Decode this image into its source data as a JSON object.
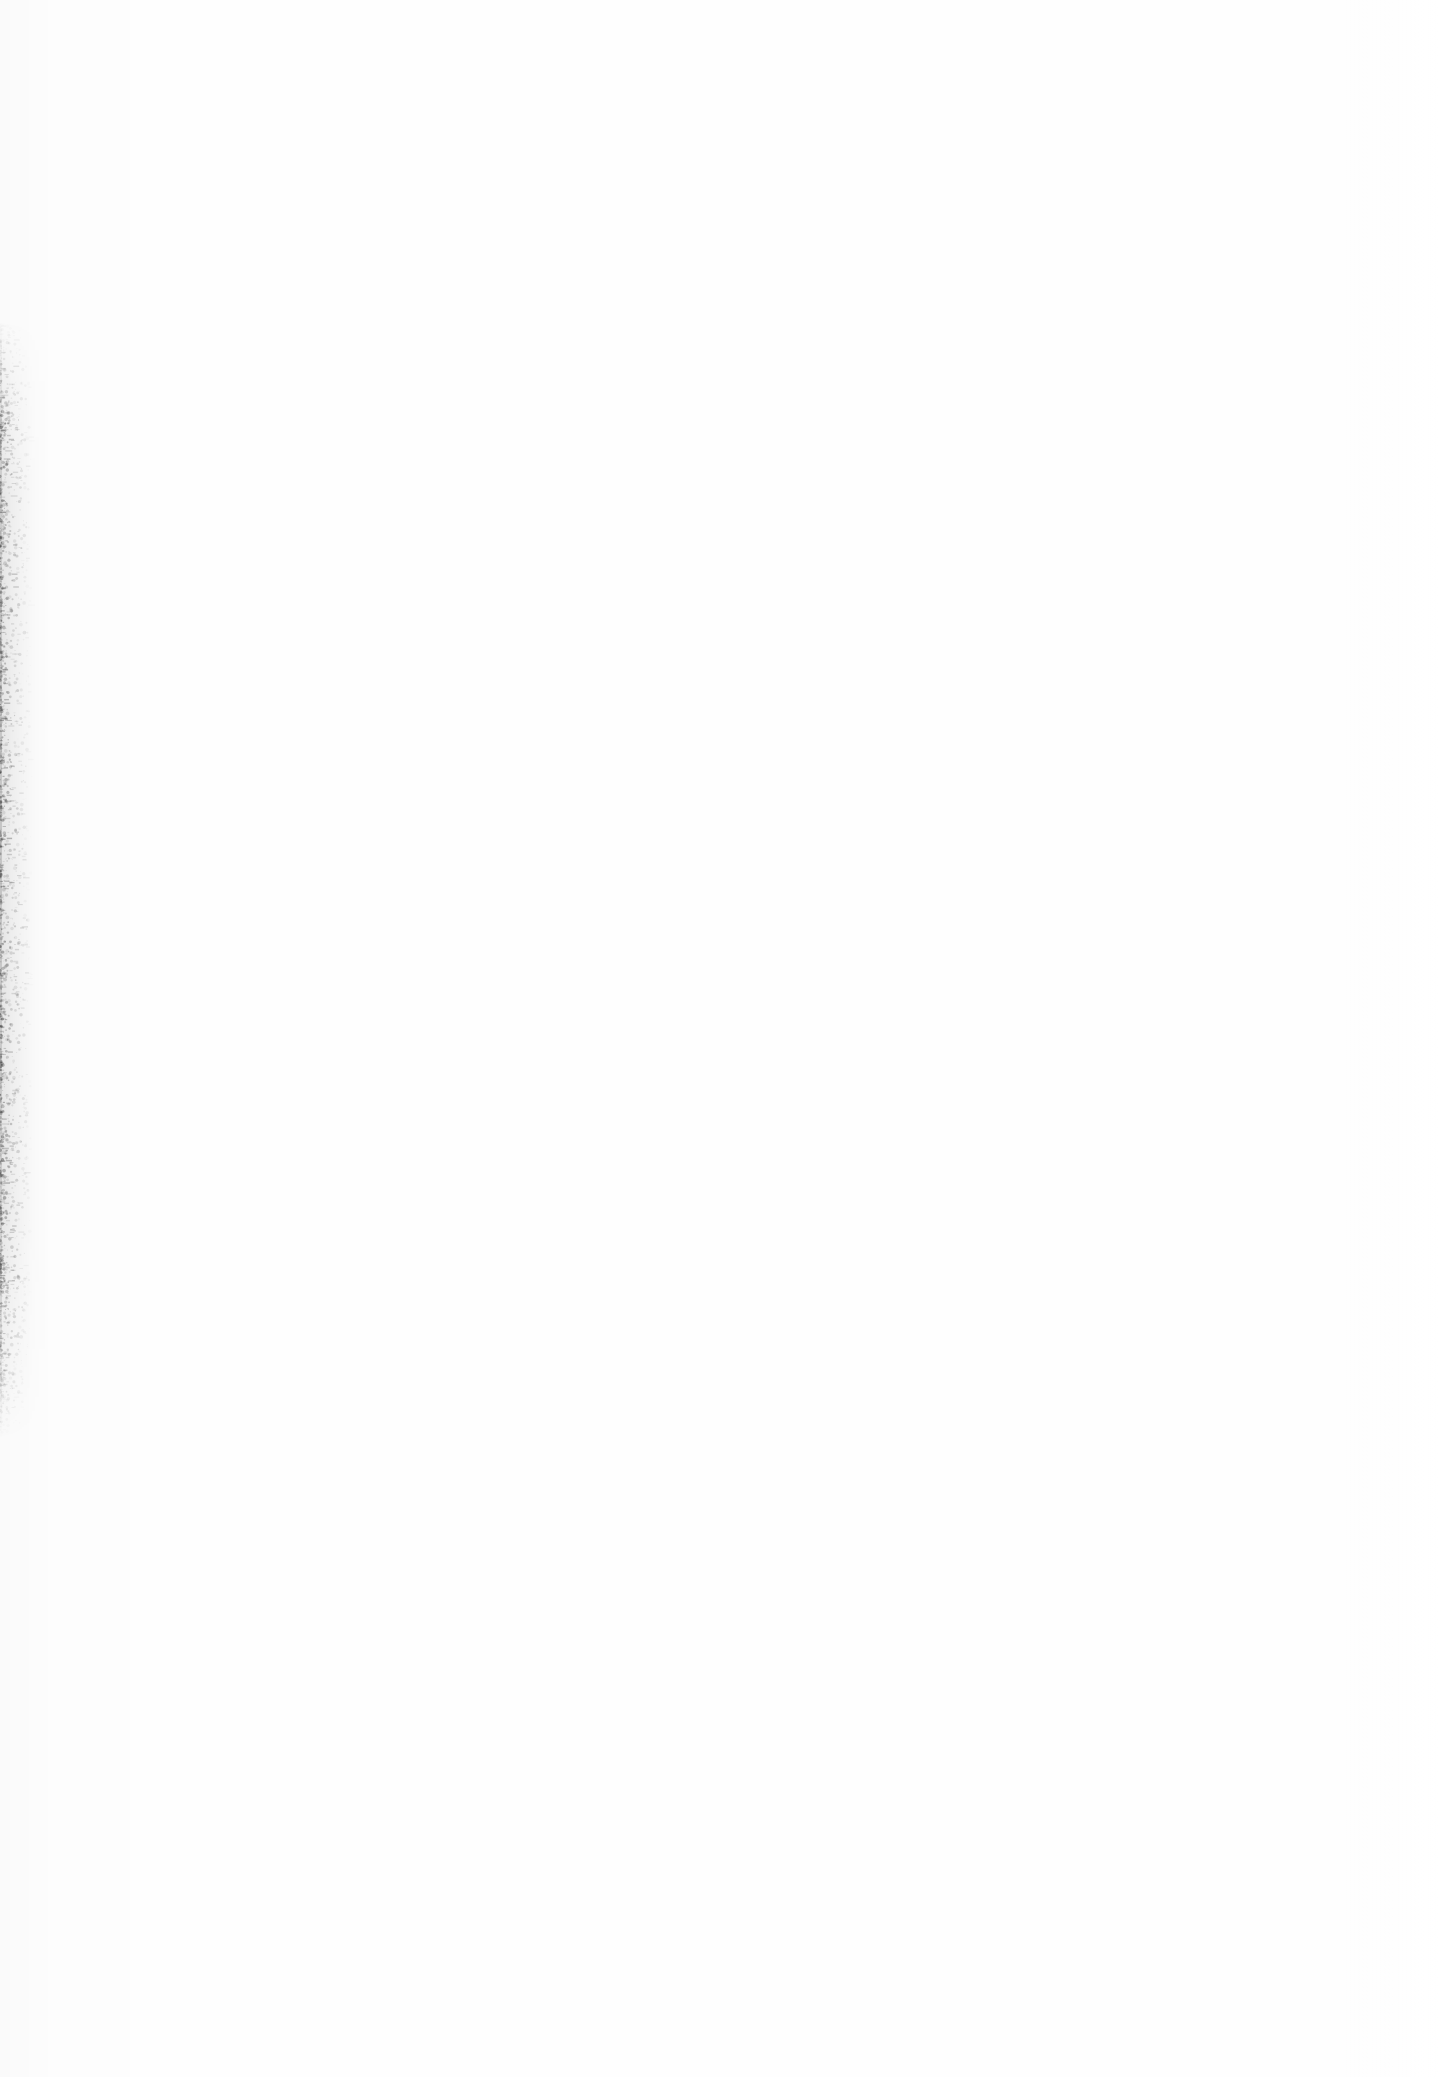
{
  "page": {
    "kind": "scanned-document-page",
    "state": "blank",
    "width": 1439,
    "height": 2077,
    "paper_color": "#fefefe",
    "ink_color": "#000000",
    "header_text": "",
    "footer_text": "",
    "page_number": "",
    "body_text": "",
    "accessible_description": "Blank scanned page with no printed text or figures"
  },
  "artifacts": {
    "gutter_band": {
      "label": "left-edge scan speckle",
      "x": 0,
      "y": 320,
      "width": 48,
      "height": 1120,
      "core_width": 25,
      "dot_count": 2600,
      "max_opacity": 0.42,
      "color": "#3a3a3a"
    },
    "edge_line": {
      "label": "sheet edge hairline",
      "y": 320,
      "height": 1120
    },
    "right_margin_strip": {
      "label": "right margin highlight",
      "x": 1408,
      "width": 31
    },
    "content_area": {
      "label": "empty text block region",
      "x": 150,
      "y": 200,
      "width": 1180,
      "height": 1700
    }
  }
}
